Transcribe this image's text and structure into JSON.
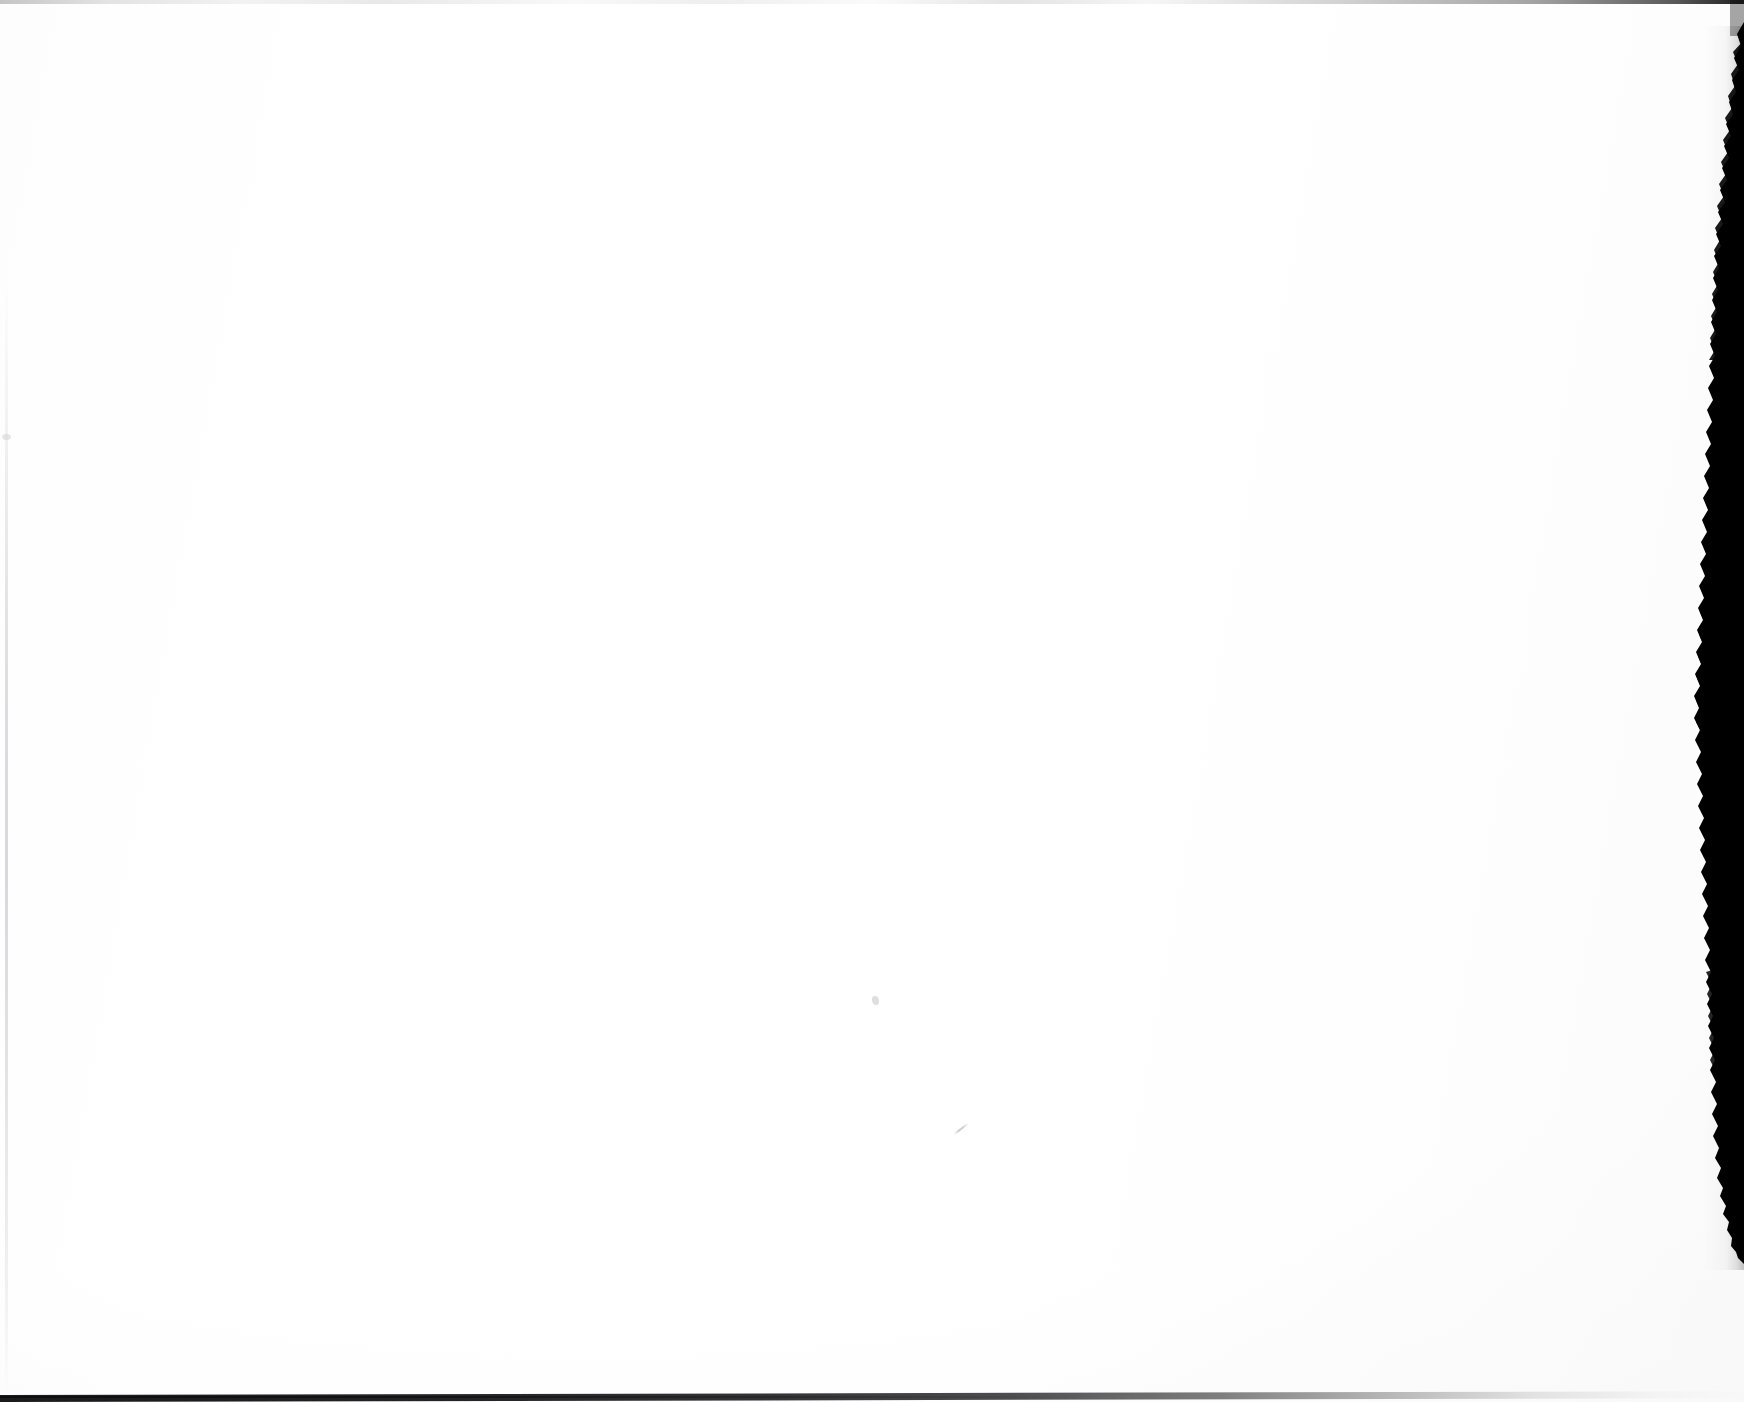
{
  "document": {
    "kind": "scanned-page",
    "content_state": "blank",
    "page_width": 1744,
    "page_height": 1402,
    "visible_text": "",
    "caption": ""
  },
  "colors": {
    "paper": "#ffffff",
    "paper_tint": "#fdfdfd",
    "scan_edge_black": "#000000",
    "bottom_line": "#121214",
    "top_line": "#c8c8ca",
    "left_line": "#d6d6da",
    "speck": "#c4c4c8"
  },
  "artifacts": {
    "top_edge": {
      "name": "top-scan-seam",
      "position": "top",
      "thickness_px": 4,
      "tone": "#c8c8ca"
    },
    "left_edge": {
      "name": "left-scan-line",
      "position": "left",
      "offset_x_px": 5,
      "thickness_px": 3,
      "tone": "#d6d6da"
    },
    "bottom_edge": {
      "name": "bottom-scan-line",
      "position": "bottom",
      "thickness_px": 7,
      "tone": "#121214"
    },
    "right_edge": {
      "name": "right-torn-edge-band",
      "position": "right",
      "starts_y_px": 30,
      "ends_y_px": 1264,
      "max_width_px": 30,
      "tone": "#000000"
    },
    "specks": [
      {
        "name": "speck-center",
        "x": 875,
        "y": 1000,
        "tone": "#c4c4c8"
      },
      {
        "name": "stroke-diagonal",
        "x": 958,
        "y": 1130,
        "tone": "#b2b2b8"
      },
      {
        "name": "speck-left-margin",
        "x": 6,
        "y": 437,
        "tone": "#d6d6da"
      }
    ]
  }
}
